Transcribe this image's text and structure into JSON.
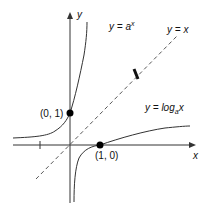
{
  "diagram": {
    "type": "function-graph",
    "axes": {
      "x_label": "x",
      "y_label": "y"
    },
    "curves": [
      {
        "id": "exp",
        "label_lhs": "y = ",
        "label_base": "a",
        "label_sup": "x"
      },
      {
        "id": "log",
        "label_lhs": "y = log",
        "label_sub": "a",
        "label_arg": "x"
      },
      {
        "id": "identity",
        "label": "y = x",
        "style": "dashed"
      }
    ],
    "points": [
      {
        "label": "(0, 1)"
      },
      {
        "label": "(1, 0)"
      }
    ],
    "colors": {
      "stroke": "#222222",
      "background": "#ffffff"
    }
  }
}
